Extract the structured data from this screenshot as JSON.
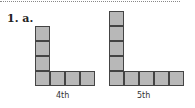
{
  "header": {
    "label": "1. a."
  },
  "figures": [
    {
      "caption": "4th",
      "vertical": 4,
      "horizontal": 4
    },
    {
      "caption": "5th",
      "vertical": 5,
      "horizontal": 5
    }
  ],
  "colors": {
    "square_fill": "#b8b8b8",
    "square_border": "#444444"
  }
}
